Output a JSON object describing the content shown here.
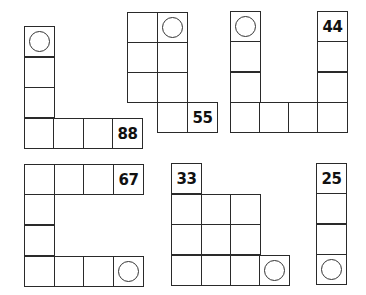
{
  "cell_size": 30,
  "shapes": [
    {
      "name": "shape-l-88",
      "cells": [
        {
          "x": 24,
          "y": 26,
          "mark": "circle"
        },
        {
          "x": 24,
          "y": 57
        },
        {
          "x": 24,
          "y": 87
        },
        {
          "x": 24,
          "y": 118
        },
        {
          "x": 53,
          "y": 118
        },
        {
          "x": 83,
          "y": 118
        },
        {
          "x": 112,
          "y": 118,
          "label": "88"
        }
      ]
    },
    {
      "name": "shape-step-55",
      "cells": [
        {
          "x": 127,
          "y": 12
        },
        {
          "x": 157,
          "y": 12,
          "mark": "circle"
        },
        {
          "x": 127,
          "y": 42
        },
        {
          "x": 157,
          "y": 42
        },
        {
          "x": 127,
          "y": 72
        },
        {
          "x": 157,
          "y": 72
        },
        {
          "x": 157,
          "y": 102
        },
        {
          "x": 187,
          "y": 102,
          "label": "55"
        }
      ]
    },
    {
      "name": "shape-u-44",
      "cells": [
        {
          "x": 230,
          "y": 11,
          "mark": "circle"
        },
        {
          "x": 317,
          "y": 11,
          "label": "44"
        },
        {
          "x": 230,
          "y": 41
        },
        {
          "x": 317,
          "y": 41
        },
        {
          "x": 230,
          "y": 72
        },
        {
          "x": 317,
          "y": 72
        },
        {
          "x": 230,
          "y": 102
        },
        {
          "x": 259,
          "y": 102
        },
        {
          "x": 288,
          "y": 102
        },
        {
          "x": 317,
          "y": 102
        }
      ]
    },
    {
      "name": "shape-c-67",
      "cells": [
        {
          "x": 24,
          "y": 164
        },
        {
          "x": 54,
          "y": 164
        },
        {
          "x": 83,
          "y": 164
        },
        {
          "x": 113,
          "y": 164,
          "label": "67"
        },
        {
          "x": 24,
          "y": 194
        },
        {
          "x": 24,
          "y": 225
        },
        {
          "x": 24,
          "y": 256
        },
        {
          "x": 54,
          "y": 256
        },
        {
          "x": 83,
          "y": 256
        },
        {
          "x": 113,
          "y": 256,
          "mark": "circle"
        }
      ]
    },
    {
      "name": "shape-block-33",
      "cells": [
        {
          "x": 171,
          "y": 163,
          "label": "33"
        },
        {
          "x": 171,
          "y": 194
        },
        {
          "x": 201,
          "y": 194
        },
        {
          "x": 230,
          "y": 194
        },
        {
          "x": 171,
          "y": 224
        },
        {
          "x": 201,
          "y": 224
        },
        {
          "x": 230,
          "y": 224
        },
        {
          "x": 171,
          "y": 255
        },
        {
          "x": 201,
          "y": 255
        },
        {
          "x": 230,
          "y": 255
        },
        {
          "x": 259,
          "y": 255,
          "mark": "circle"
        }
      ]
    },
    {
      "name": "shape-i-25",
      "cells": [
        {
          "x": 316,
          "y": 163,
          "label": "25"
        },
        {
          "x": 316,
          "y": 193
        },
        {
          "x": 316,
          "y": 224
        },
        {
          "x": 316,
          "y": 254,
          "mark": "circle"
        }
      ]
    }
  ]
}
